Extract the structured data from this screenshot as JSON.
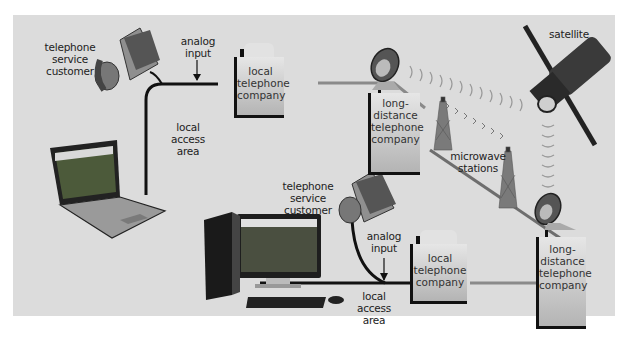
{
  "diagram": {
    "colors": {
      "panel_bg": "#dcdcdc",
      "page_bg": "#ffffff",
      "cable": "#1a1a1a",
      "trunk_line": "#8a8a8a",
      "building": "#c8c8c8"
    },
    "nodes": {
      "customer_top": {
        "label": "telephone\nservice customer"
      },
      "analog_top": {
        "label": "analog\ninput"
      },
      "local_company_top": {
        "label": "local\ntelephone\ncompany"
      },
      "local_access_top": {
        "label": "local\naccess\narea"
      },
      "long_distance_top": {
        "label": "long-\ndistance\ntelephone\ncompany"
      },
      "satellite": {
        "label": "satellite"
      },
      "microwave": {
        "label": "microwave\nstations"
      },
      "customer_bottom": {
        "label": "telephone\nservice customer"
      },
      "analog_bottom": {
        "label": "analog\ninput"
      },
      "local_company_bottom": {
        "label": "local\ntelephone\ncompany"
      },
      "local_access_bottom": {
        "label": "local\naccess\narea"
      },
      "long_distance_bottom": {
        "label": "long-\ndistance\ntelephone\ncompany"
      }
    },
    "icons": [
      "telephone-icon",
      "laptop-icon",
      "desktop-computer-icon",
      "satellite-dish-icon",
      "microwave-tower-icon",
      "satellite-icon",
      "building-icon"
    ]
  }
}
